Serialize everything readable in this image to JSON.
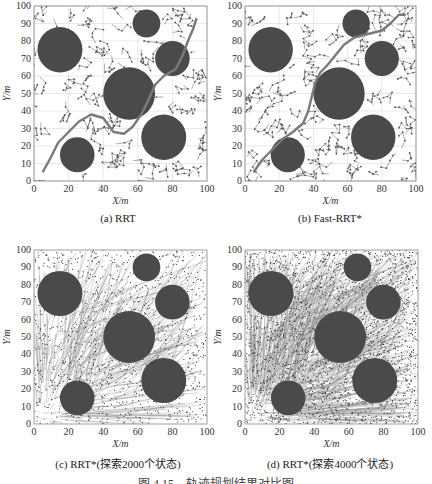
{
  "figure_caption": "图 4.15　轨迹规划结果对比图",
  "chart_data": [
    {
      "type": "scatter",
      "id": "a",
      "title": "(a) RRT",
      "xlabel": "X/m",
      "ylabel": "Y/m",
      "xlim": [
        0,
        100
      ],
      "ylim": [
        0,
        100
      ],
      "xticks": [
        0,
        20,
        40,
        60,
        80,
        100
      ],
      "yticks": [
        0,
        10,
        20,
        30,
        40,
        50,
        60,
        70,
        80,
        90,
        100
      ],
      "grid": true,
      "obstacles": [
        {
          "x": 15,
          "y": 75,
          "r": 13
        },
        {
          "x": 65,
          "y": 90,
          "r": 8
        },
        {
          "x": 80,
          "y": 70,
          "r": 10
        },
        {
          "x": 55,
          "y": 50,
          "r": 15
        },
        {
          "x": 75,
          "y": 25,
          "r": 13
        },
        {
          "x": 25,
          "y": 15,
          "r": 10
        }
      ],
      "path": [
        [
          5,
          5
        ],
        [
          10,
          14
        ],
        [
          14,
          22
        ],
        [
          20,
          28
        ],
        [
          26,
          34
        ],
        [
          33,
          38
        ],
        [
          40,
          36
        ],
        [
          46,
          28
        ],
        [
          52,
          27
        ],
        [
          57,
          31
        ],
        [
          62,
          38
        ],
        [
          66,
          46
        ],
        [
          70,
          55
        ],
        [
          75,
          60
        ],
        [
          82,
          64
        ],
        [
          86,
          72
        ],
        [
          89,
          80
        ],
        [
          92,
          87
        ],
        [
          94,
          93
        ]
      ],
      "tree_density": "sparse"
    },
    {
      "type": "scatter",
      "id": "b",
      "title": "(b) Fast-RRT*",
      "xlabel": "X/m",
      "ylabel": "Y/m",
      "xlim": [
        0,
        100
      ],
      "ylim": [
        0,
        100
      ],
      "xticks": [
        0,
        20,
        40,
        60,
        80,
        100
      ],
      "yticks": [
        0,
        10,
        20,
        30,
        40,
        50,
        60,
        70,
        80,
        90,
        100
      ],
      "grid": true,
      "obstacles": [
        {
          "x": 15,
          "y": 75,
          "r": 13
        },
        {
          "x": 65,
          "y": 90,
          "r": 8
        },
        {
          "x": 80,
          "y": 70,
          "r": 10
        },
        {
          "x": 55,
          "y": 50,
          "r": 15
        },
        {
          "x": 75,
          "y": 25,
          "r": 13
        },
        {
          "x": 25,
          "y": 15,
          "r": 10
        }
      ],
      "path": [
        [
          5,
          5
        ],
        [
          10,
          12
        ],
        [
          16,
          18
        ],
        [
          22,
          24
        ],
        [
          28,
          28
        ],
        [
          34,
          33
        ],
        [
          37,
          40
        ],
        [
          39,
          48
        ],
        [
          41,
          56
        ],
        [
          44,
          62
        ],
        [
          48,
          66
        ],
        [
          53,
          72
        ],
        [
          58,
          78
        ],
        [
          64,
          82
        ],
        [
          72,
          84
        ],
        [
          80,
          86
        ],
        [
          85,
          90
        ],
        [
          90,
          95
        ],
        [
          94,
          95
        ]
      ],
      "tree_density": "sparse"
    },
    {
      "type": "scatter",
      "id": "c",
      "title": "(c) RRT*(探索2000个状态)",
      "xlabel": "X/m",
      "ylabel": "Y/m",
      "xlim": [
        0,
        100
      ],
      "ylim": [
        0,
        100
      ],
      "xticks": [
        0,
        20,
        40,
        60,
        80,
        100
      ],
      "yticks": [
        0,
        10,
        20,
        30,
        40,
        50,
        60,
        70,
        80,
        90,
        100
      ],
      "grid": false,
      "obstacles": [
        {
          "x": 15,
          "y": 75,
          "r": 13
        },
        {
          "x": 65,
          "y": 90,
          "r": 8
        },
        {
          "x": 80,
          "y": 70,
          "r": 10
        },
        {
          "x": 55,
          "y": 50,
          "r": 15
        },
        {
          "x": 75,
          "y": 25,
          "r": 13
        },
        {
          "x": 25,
          "y": 15,
          "r": 10
        }
      ],
      "explored_states": 2000,
      "tree_density": "dense"
    },
    {
      "type": "scatter",
      "id": "d",
      "title": "(d) RRT*(探索4000个状态)",
      "xlabel": "X/m",
      "ylabel": "Y/m",
      "xlim": [
        0,
        100
      ],
      "ylim": [
        0,
        100
      ],
      "xticks": [
        0,
        20,
        40,
        60,
        80,
        100
      ],
      "yticks": [
        0,
        10,
        20,
        30,
        40,
        50,
        60,
        70,
        80,
        90,
        100
      ],
      "grid": false,
      "obstacles": [
        {
          "x": 15,
          "y": 75,
          "r": 13
        },
        {
          "x": 65,
          "y": 90,
          "r": 8
        },
        {
          "x": 80,
          "y": 70,
          "r": 10
        },
        {
          "x": 55,
          "y": 50,
          "r": 15
        },
        {
          "x": 75,
          "y": 25,
          "r": 13
        },
        {
          "x": 25,
          "y": 15,
          "r": 10
        }
      ],
      "explored_states": 4000,
      "tree_density": "very-dense"
    }
  ],
  "colors": {
    "obstacle": "#4a4a4a",
    "path": "#7a7a7a",
    "tree": "#555555",
    "grid": "#d8d8d8",
    "axis": "#888888"
  },
  "panels_layout": [
    {
      "left": 34,
      "top": 6,
      "width": 173,
      "height": 175,
      "caption_top": 212
    },
    {
      "left": 245,
      "top": 6,
      "width": 171,
      "height": 175,
      "caption_top": 212
    },
    {
      "left": 34,
      "top": 250,
      "width": 173,
      "height": 174,
      "caption_top": 455
    },
    {
      "left": 245,
      "top": 250,
      "width": 173,
      "height": 174,
      "caption_top": 455
    }
  ]
}
